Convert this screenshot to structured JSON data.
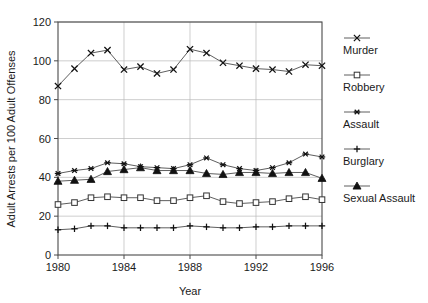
{
  "chart_data": {
    "type": "line",
    "title": "",
    "xlabel": "Year",
    "ylabel": "Adult Arrests per 100 Adult Offenses",
    "x": [
      1980,
      1981,
      1982,
      1983,
      1984,
      1985,
      1986,
      1987,
      1988,
      1989,
      1990,
      1991,
      1992,
      1993,
      1994,
      1995,
      1996
    ],
    "xlim": [
      1980,
      1996
    ],
    "ylim": [
      0,
      120
    ],
    "xticks": [
      1980,
      1984,
      1988,
      1992,
      1996
    ],
    "yticks": [
      0,
      20,
      40,
      60,
      80,
      100,
      120
    ],
    "grid": true,
    "legend_position": "right",
    "series": [
      {
        "name": "Murder",
        "marker": "x-cross",
        "values": [
          87,
          96,
          104,
          105.5,
          95.5,
          97,
          93.5,
          95.5,
          106,
          104,
          99,
          97.5,
          96,
          95.5,
          94.5,
          98,
          97.5
        ]
      },
      {
        "name": "Robbery",
        "marker": "open-square",
        "values": [
          26,
          27,
          29.5,
          30,
          29.5,
          29.5,
          28,
          28,
          29.5,
          30.5,
          27.5,
          26.5,
          27,
          27.5,
          29,
          30,
          28.5
        ]
      },
      {
        "name": "Assault",
        "marker": "asterisk",
        "values": [
          42,
          43.5,
          44.5,
          47.5,
          47,
          45.5,
          45,
          44.5,
          46.5,
          50,
          46.5,
          44.5,
          43.5,
          45,
          47.5,
          52,
          50.5
        ]
      },
      {
        "name": "Burglary",
        "marker": "plus",
        "values": [
          13,
          13.5,
          15,
          15,
          14,
          14,
          14,
          14,
          15,
          14.5,
          14,
          14,
          14.5,
          14.5,
          15,
          15,
          15
        ]
      },
      {
        "name": "Sexual Assault",
        "marker": "filled-triangle",
        "values": [
          38,
          38.5,
          39,
          43,
          44,
          45,
          43.5,
          43.5,
          43.5,
          42,
          41.5,
          42.5,
          42.5,
          42,
          42.5,
          42.5,
          39.5
        ]
      }
    ]
  },
  "axis": {
    "x_title": "Year",
    "y_title": "Adult Arrests per 100 Adult Offenses",
    "x_tick_labels": [
      "1980",
      "1984",
      "1988",
      "1992",
      "1996"
    ],
    "y_tick_labels": [
      "0",
      "20",
      "40",
      "60",
      "80",
      "100",
      "120"
    ]
  },
  "legend": {
    "entries": [
      {
        "label": "Murder",
        "marker": "x-cross"
      },
      {
        "label": "Robbery",
        "marker": "open-square"
      },
      {
        "label": "Assault",
        "marker": "asterisk"
      },
      {
        "label": "Burglary",
        "marker": "plus"
      },
      {
        "label": "Sexual Assault",
        "marker": "filled-triangle"
      }
    ]
  },
  "colors": {
    "line": "#4c4c4c",
    "marker": "#111111",
    "grid": "#b9b9b9",
    "frame": "#4a4a4a",
    "background": "#ffffff"
  }
}
